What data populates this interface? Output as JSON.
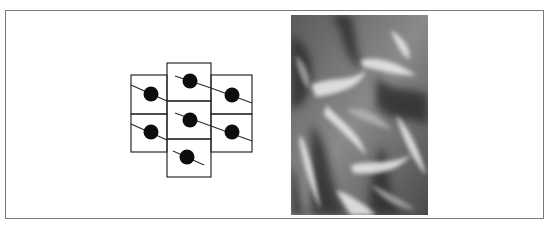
{
  "figure": {
    "diagram": {
      "type": "tiled-cells",
      "columns": [
        {
          "name": "left",
          "x": 131,
          "width": 36,
          "cells": [
            {
              "y": 75,
              "h": 39
            },
            {
              "y": 114,
              "h": 38
            }
          ]
        },
        {
          "name": "center",
          "x": 167,
          "width": 44,
          "cells": [
            {
              "y": 63,
              "h": 38
            },
            {
              "y": 101,
              "h": 38
            },
            {
              "y": 139,
              "h": 38
            }
          ]
        },
        {
          "name": "right",
          "x": 211,
          "width": 41,
          "cells": [
            {
              "y": 75,
              "h": 39
            },
            {
              "y": 114,
              "h": 38
            }
          ]
        }
      ],
      "dots": [
        {
          "cx": 151,
          "cy": 94
        },
        {
          "cx": 151,
          "cy": 132
        },
        {
          "cx": 190,
          "cy": 81
        },
        {
          "cx": 190,
          "cy": 120
        },
        {
          "cx": 187,
          "cy": 157
        },
        {
          "cx": 232,
          "cy": 95
        },
        {
          "cx": 232,
          "cy": 132
        }
      ],
      "colors": {
        "stroke": "#2a2a2a",
        "dot": "#0d0d0d",
        "background": "#ffffff"
      }
    },
    "photo": {
      "subject": "crumpled metallic satin fabric",
      "tone": "grayscale"
    },
    "frame_color": "#7a7a7a"
  }
}
